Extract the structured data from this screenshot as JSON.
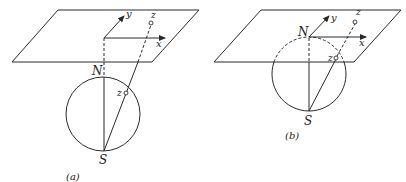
{
  "figure_a": {
    "caption": "(a)",
    "labels": {
      "north": "N",
      "south": "S",
      "x_axis": "x",
      "y_axis": "y",
      "point_plane": "z",
      "point_sphere": "z"
    },
    "plane": [
      [
        58,
        10
      ],
      [
        199,
        10
      ],
      [
        152,
        62
      ],
      [
        12,
        62
      ]
    ],
    "sphere": {
      "cx": 103,
      "cy": 114,
      "r": 37
    },
    "origin": [
      104,
      38
    ],
    "x_arrow_end": [
      165,
      38
    ],
    "y_arrow_end": [
      124,
      16
    ],
    "plane_point": [
      151,
      23
    ],
    "sphere_point": [
      126,
      93
    ],
    "south": [
      104,
      151
    ]
  },
  "figure_b": {
    "caption": "(b)",
    "labels": {
      "north": "N",
      "south": "S",
      "x_axis": "x",
      "y_axis": "y",
      "point_plane": "z",
      "point_sphere": "z"
    },
    "plane": [
      [
        261,
        10
      ],
      [
        401,
        10
      ],
      [
        354,
        62
      ],
      [
        214,
        62
      ]
    ],
    "sphere": {
      "cx": 309,
      "cy": 74,
      "r": 37
    },
    "origin": [
      309,
      37
    ],
    "x_arrow_end": [
      366,
      37
    ],
    "y_arrow_end": [
      329,
      16
    ],
    "plane_point": [
      355,
      22
    ],
    "sphere_point": [
      336,
      58
    ],
    "south": [
      309,
      111
    ]
  }
}
